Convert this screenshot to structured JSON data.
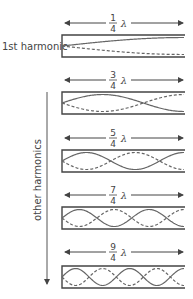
{
  "labels": {
    "first": "1st harmonic",
    "others": "other harmonics",
    "lambda": "λ"
  },
  "colors": {
    "wall": "#444444",
    "wave": "#666666",
    "text": "#444444"
  },
  "tubes": [
    {
      "num": "1",
      "den": "4",
      "n": 1,
      "arrow_y": 23,
      "top": 35,
      "bottom": 57
    },
    {
      "num": "3",
      "den": "4",
      "n": 3,
      "arrow_y": 80,
      "top": 92,
      "bottom": 114
    },
    {
      "num": "5",
      "den": "4",
      "n": 5,
      "arrow_y": 138,
      "top": 150,
      "bottom": 172
    },
    {
      "num": "7",
      "den": "4",
      "n": 7,
      "arrow_y": 195,
      "top": 207,
      "bottom": 229
    },
    {
      "num": "9",
      "den": "4",
      "n": 9,
      "arrow_y": 252,
      "top": 266,
      "bottom": 288
    }
  ]
}
